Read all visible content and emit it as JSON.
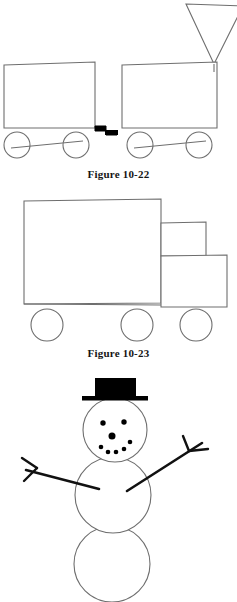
{
  "page": {
    "background_color": "#ffffff",
    "width": 237,
    "height": 602,
    "figure_count": 3
  },
  "colors": {
    "line": "#6e6e6e",
    "line_dark": "#4a4a4a",
    "ink_black": "#000000",
    "caption_text": "#141414",
    "background": "#ffffff"
  },
  "figures": [
    {
      "id": "figure-10-22",
      "caption": "Figure 10-22",
      "subject": "train",
      "description": "Two boxcars joined by a black step-shaped coupling, each riding on two circular wheels, with an inverted-triangle smokestack funnel at the upper right.",
      "parts": {
        "car_rear": {
          "name": "rear boxcar",
          "x": 4,
          "y": 64,
          "width": 91,
          "height": 64
        },
        "car_front": {
          "name": "front boxcar",
          "x": 122,
          "y": 64,
          "width": 95,
          "height": 64
        },
        "coupling": {
          "name": "coupling",
          "x": 95,
          "y": 126,
          "width": 22,
          "height": 9,
          "fill": "#000000"
        },
        "funnel": {
          "name": "smokestack funnel",
          "shape": "inverted-triangle",
          "apex_x": 214,
          "apex_y": 64,
          "top_y": 4,
          "left_x": 186,
          "right_x": 243
        },
        "wheels": [
          {
            "cx": 17,
            "cy": 145,
            "r": 13
          },
          {
            "cx": 76,
            "cy": 145,
            "r": 13
          },
          {
            "cx": 140,
            "cy": 145,
            "r": 13
          },
          {
            "cx": 199,
            "cy": 145,
            "r": 13
          }
        ],
        "axle_rods": [
          {
            "x1": 12,
            "y1": 148,
            "x2": 82,
            "y2": 142
          },
          {
            "x1": 135,
            "y1": 148,
            "x2": 205,
            "y2": 142
          }
        ]
      }
    },
    {
      "id": "figure-10-23",
      "caption": "Figure 10-23",
      "subject": "truck",
      "description": "A side view of a box truck: a large rectangular trailer, a stacked cab made of an upper window box and a lower hood box, resting on three circular wheels.",
      "parts": {
        "trailer": {
          "name": "trailer box",
          "x": 24,
          "y": 200,
          "width": 137,
          "height": 103
        },
        "cab_upper": {
          "name": "cab upper box",
          "x": 161,
          "y": 222,
          "width": 45,
          "height": 34
        },
        "cab_lower": {
          "name": "cab lower box",
          "x": 161,
          "y": 256,
          "width": 66,
          "height": 51
        },
        "wheels": [
          {
            "cx": 47,
            "cy": 325,
            "r": 16
          },
          {
            "cx": 137,
            "cy": 325,
            "r": 16
          },
          {
            "cx": 196,
            "cy": 325,
            "r": 16
          }
        ]
      }
    },
    {
      "id": "figure-snowman",
      "caption": "",
      "subject": "snowman",
      "description": "A snowman drawn from three stacked circles, wearing a solid black top hat, with a dotted face of two eyes, a round nose and a five-dot smile, and two bare twig arms.",
      "parts": {
        "hat_crown": {
          "name": "hat crown",
          "x": 95,
          "y": 378,
          "width": 41,
          "height": 20,
          "fill": "#000000"
        },
        "hat_brim": {
          "name": "hat brim",
          "x": 82,
          "y": 397,
          "width": 66,
          "height": 4,
          "fill": "#000000"
        },
        "head": {
          "name": "head circle",
          "cx": 115,
          "cy": 430,
          "r": 32
        },
        "torso": {
          "name": "torso circle",
          "cx": 113,
          "cy": 495,
          "r": 38
        },
        "base": {
          "name": "base circle",
          "cx": 112,
          "cy": 564,
          "r": 38
        },
        "face_dots": [
          {
            "name": "left eye",
            "cx": 103,
            "cy": 423,
            "r": 2.6
          },
          {
            "name": "right eye",
            "cx": 124,
            "cy": 422,
            "r": 2.6
          },
          {
            "name": "nose",
            "cx": 112,
            "cy": 436,
            "r": 3.4
          },
          {
            "name": "smile dot 1",
            "cx": 101,
            "cy": 447,
            "r": 2.2
          },
          {
            "name": "smile dot 2",
            "cx": 108,
            "cy": 451,
            "r": 2.2
          },
          {
            "name": "smile dot 3",
            "cx": 116,
            "cy": 451,
            "r": 2.2
          },
          {
            "name": "smile dot 4",
            "cx": 124,
            "cy": 448,
            "r": 2.2
          },
          {
            "name": "smile dot 5",
            "cx": 130,
            "cy": 442,
            "r": 2.2
          }
        ],
        "arm_left": {
          "name": "left arm twig",
          "main": {
            "x1": 99,
            "y1": 488,
            "x2": 26,
            "y2": 470
          },
          "twigs": [
            {
              "x1": 36,
              "y1": 468,
              "x2": 23,
              "y2": 459
            },
            {
              "x1": 36,
              "y1": 468,
              "x2": 25,
              "y2": 480
            }
          ]
        },
        "arm_right": {
          "name": "right arm twig",
          "main": {
            "x1": 127,
            "y1": 490,
            "x2": 201,
            "y2": 444
          },
          "twigs": [
            {
              "x1": 189,
              "y1": 451,
              "x2": 183,
              "y2": 437
            },
            {
              "x1": 189,
              "y1": 451,
              "x2": 207,
              "y2": 449
            }
          ]
        }
      }
    }
  ]
}
